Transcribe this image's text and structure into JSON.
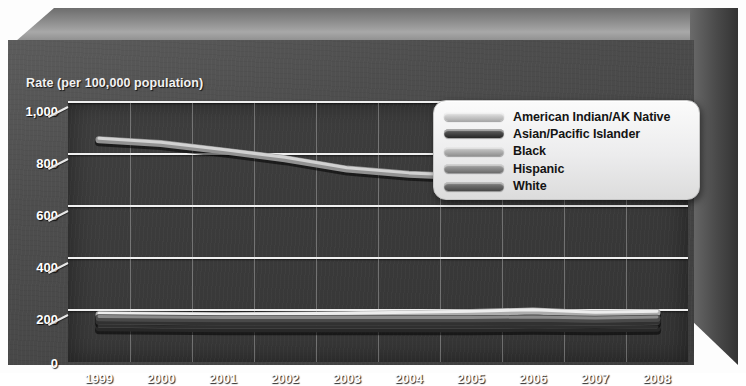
{
  "chart": {
    "type": "line",
    "axis_title": "Rate (per 100,000 population)",
    "ylabel": "Rate (per 100,000 population)",
    "xlabel": "",
    "title": "",
    "grid": "horizontal-and-vertical",
    "legend_position": "top-right",
    "ylim": [
      0,
      1000
    ],
    "yticks": [
      "0",
      "200",
      "400",
      "600",
      "800",
      "1,000"
    ],
    "ytick_values": [
      0,
      200,
      400,
      600,
      800,
      1000
    ],
    "categories": [
      "1999",
      "2000",
      "2001",
      "2002",
      "2003",
      "2004",
      "2005",
      "2006",
      "2007",
      "2008"
    ],
    "series": [
      {
        "name": "American Indian/AK Native",
        "color": "#cfcfcf",
        "values": [
          182,
          180,
          178,
          180,
          182,
          186,
          190,
          196,
          186,
          190
        ]
      },
      {
        "name": "Asian/Pacific Islander",
        "color": "#4a4a4a",
        "values": [
          132,
          130,
          128,
          128,
          128,
          128,
          128,
          130,
          128,
          130
        ]
      },
      {
        "name": "Black",
        "color": "#b4b4b4",
        "values": [
          855,
          840,
          812,
          782,
          742,
          722,
          712,
          706,
          700,
          710
        ]
      },
      {
        "name": "Hispanic",
        "color": "#8f8f8f",
        "values": [
          158,
          156,
          154,
          154,
          154,
          154,
          154,
          156,
          152,
          156
        ]
      },
      {
        "name": "White",
        "color": "#6b6b6b",
        "values": [
          170,
          168,
          166,
          166,
          166,
          166,
          166,
          168,
          164,
          168
        ]
      }
    ]
  },
  "legend": {
    "items": [
      "American Indian/AK Native",
      "Asian/Pacific Islander",
      "Black",
      "Hispanic",
      "White"
    ]
  },
  "colors": {
    "plot_background": "#3a3a3a",
    "frame": "#4e4e4e",
    "gridline": "#f0f0f0",
    "label_text": "#ffffff",
    "legend_background": "#ececed",
    "legend_text": "#141414"
  }
}
